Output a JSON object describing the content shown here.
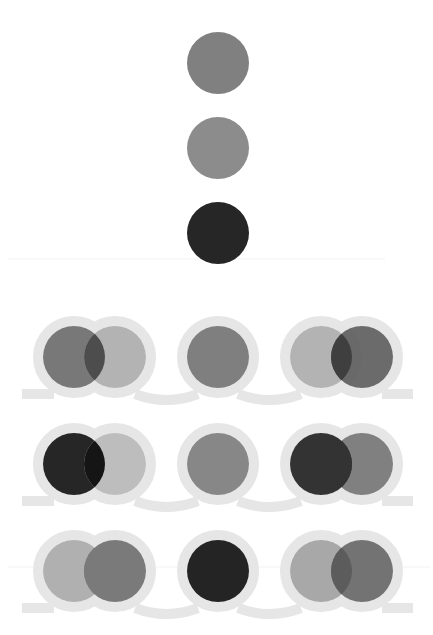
{
  "canvas": {
    "width": 433,
    "height": 635,
    "background": "#ffffff"
  },
  "colors": {
    "ring": "#e6e6e6",
    "divider": "#f2f2f2"
  },
  "legend_circles": [
    {
      "id": "source-a",
      "cx": 218,
      "cy": 63,
      "r": 31,
      "fill": "#808080"
    },
    {
      "id": "source-b",
      "cx": 218,
      "cy": 148,
      "r": 31,
      "fill": "#8c8c8c"
    },
    {
      "id": "source-c",
      "cx": 218,
      "cy": 233,
      "r": 31,
      "fill": "#262626"
    }
  ],
  "divider_lines": [
    {
      "y": 259,
      "x1": 8,
      "x2": 385
    },
    {
      "y": 567,
      "x1": 8,
      "x2": 430
    }
  ],
  "rows": [
    {
      "cy": 357,
      "groups": [
        {
          "type": "pair",
          "left": {
            "cx": 74,
            "fill": "#787878",
            "opacity": 1
          },
          "right": {
            "cx": 115,
            "fill": "#b3b3b3",
            "opacity": 1
          },
          "overlap_fill": "#4d4d4d"
        },
        {
          "type": "single",
          "circle": {
            "cx": 218,
            "fill": "#7f7f7f",
            "opacity": 1
          }
        },
        {
          "type": "pair",
          "left": {
            "cx": 321,
            "fill": "#b3b3b3",
            "opacity": 1
          },
          "right": {
            "cx": 362,
            "fill": "#5e5e5e",
            "opacity": 0.92
          },
          "overlap_fill": "#3f3f3f"
        }
      ]
    },
    {
      "cy": 464,
      "groups": [
        {
          "type": "pair",
          "left": {
            "cx": 74,
            "fill": "#262626",
            "opacity": 1
          },
          "right": {
            "cx": 115,
            "fill": "#bdbdbd",
            "opacity": 1
          },
          "overlap_fill": "#151515"
        },
        {
          "type": "single",
          "circle": {
            "cx": 218,
            "fill": "#878787",
            "opacity": 1
          }
        },
        {
          "type": "pair",
          "left": {
            "cx": 321,
            "fill": "#333333",
            "opacity": 1
          },
          "right": {
            "cx": 362,
            "fill": "#808080",
            "opacity": 1
          },
          "overlap_fill": "#333333",
          "left_on_top": true
        }
      ]
    },
    {
      "cy": 571,
      "groups": [
        {
          "type": "pair",
          "left": {
            "cx": 74,
            "fill": "#b0b0b0",
            "opacity": 1
          },
          "right": {
            "cx": 115,
            "fill": "#7a7a7a",
            "opacity": 1
          },
          "overlap_fill": "#7a7a7a"
        },
        {
          "type": "single",
          "circle": {
            "cx": 218,
            "fill": "#242424",
            "opacity": 1
          }
        },
        {
          "type": "pair",
          "left": {
            "cx": 321,
            "fill": "#a8a8a8",
            "opacity": 1
          },
          "right": {
            "cx": 362,
            "fill": "#737373",
            "opacity": 1
          },
          "overlap_fill": "#5c5c5c"
        }
      ]
    }
  ],
  "geometry": {
    "circle_r": 31,
    "ring_outer_r": 41,
    "ring_width": 10,
    "band_left": 22,
    "band_right": 413
  }
}
